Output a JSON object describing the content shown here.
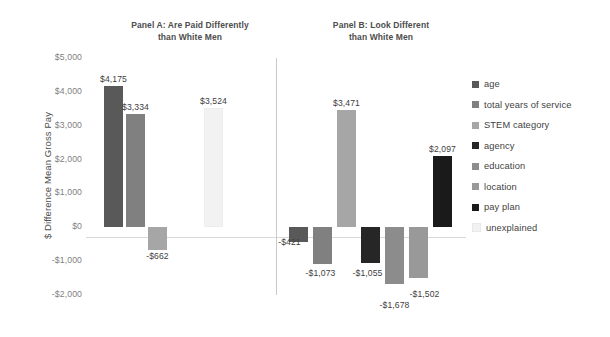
{
  "chart_data": {
    "type": "bar",
    "title": "",
    "panels": [
      {
        "id": "panel-a",
        "title_line1": "Panel A: Are Paid Differently",
        "title_line2": "than White Men",
        "categories": [
          "age",
          "total years of service",
          "STEM category",
          "unexplained"
        ],
        "values": [
          4175,
          3334,
          -662,
          3524
        ],
        "labels": [
          "$4,175",
          "$3,334",
          "-$662",
          "$3,524"
        ]
      },
      {
        "id": "panel-b",
        "title_line1": "Panel B: Look Different",
        "title_line2": "than White Men",
        "categories": [
          "age",
          "total years of service",
          "STEM category",
          "agency",
          "education",
          "location",
          "pay plan"
        ],
        "values": [
          -421,
          -1073,
          3471,
          -1055,
          -1678,
          -1502,
          2097
        ],
        "labels": [
          "-$421",
          "-$1,073",
          "$3,471",
          "-$1,055",
          "-$1,678",
          "-$1,502",
          "$2,097"
        ]
      }
    ],
    "ylabel": "$ Difference Mean Gross Pay",
    "xlabel": "",
    "ylim": [
      -2000,
      5000
    ],
    "ytick_labels": [
      "$5,000",
      "$4,000",
      "$3,000",
      "$2,000",
      "$1,000",
      "$0",
      "-$1,000",
      "-$2,000"
    ],
    "ytick_values": [
      5000,
      4000,
      3000,
      2000,
      1000,
      0,
      -1000,
      -2000
    ],
    "grid": false,
    "legend_position": "right",
    "legend": [
      {
        "label": "age",
        "color": "#595959"
      },
      {
        "label": "total years of service",
        "color": "#808080"
      },
      {
        "label": "STEM category",
        "color": "#a6a6a6"
      },
      {
        "label": "agency",
        "color": "#262626"
      },
      {
        "label": "education",
        "color": "#8c8c8c"
      },
      {
        "label": "location",
        "color": "#999999"
      },
      {
        "label": "pay plan",
        "color": "#1a1a1a"
      },
      {
        "label": "unexplained",
        "color": "#f2f2f2"
      }
    ]
  }
}
